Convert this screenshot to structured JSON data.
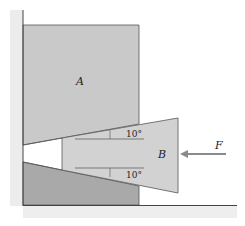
{
  "diagram": {
    "block_a_label": "A",
    "wedge_b_label": "B",
    "force_label": "F",
    "angle_top": "10°",
    "angle_bottom": "10°",
    "colors": {
      "block_fill": "#c9c9c9",
      "lower_block_fill": "#a9a9a9",
      "wedge_fill": "#d2d2d2",
      "stroke": "#555555",
      "arrow": "#8a8a8a",
      "wall_shade": "#e6e6e6"
    }
  }
}
